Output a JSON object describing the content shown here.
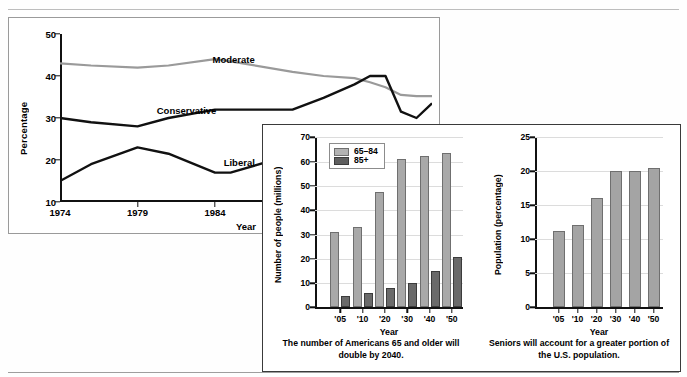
{
  "chart_data": [
    {
      "type": "line",
      "panel": "political-ideology-trend",
      "title": "",
      "xlabel": "Year",
      "ylabel": "Percentage",
      "ylim": [
        10,
        50
      ],
      "yticks": [
        10,
        20,
        30,
        40,
        50
      ],
      "xticks": [
        "1974",
        "1979",
        "1984",
        "1989",
        "1994"
      ],
      "x": [
        1974,
        1976,
        1979,
        1981,
        1984,
        1985,
        1989,
        1991,
        1993,
        1994,
        1995,
        1996,
        1997,
        1998
      ],
      "grid": false,
      "legend": "inline-labels",
      "series": [
        {
          "name": "Moderate",
          "color": "#9a9a9a",
          "label_x_pct": 41,
          "label_y_pct": 12,
          "values": [
            43.0,
            42.5,
            42.0,
            42.5,
            44.0,
            43.5,
            41.0,
            40.0,
            39.5,
            38.5,
            37.3,
            35.5,
            35.2,
            35.2
          ]
        },
        {
          "name": "Conservative",
          "color": "#111111",
          "label_x_pct": 26,
          "label_y_pct": 42,
          "values": [
            30.0,
            29.0,
            28.0,
            30.0,
            32.0,
            32.0,
            32.0,
            34.8,
            38.0,
            40.0,
            40.0,
            31.5,
            30.0,
            33.5
          ]
        },
        {
          "name": "Liberal",
          "color": "#111111",
          "label_x_pct": 44,
          "label_y_pct": 73,
          "values": [
            15.0,
            19.0,
            23.0,
            21.5,
            17.0,
            17.0,
            21.3,
            21.0,
            20.8,
            20.5,
            20.0,
            19.5,
            22.5,
            26.5
          ]
        }
      ]
    },
    {
      "type": "bar",
      "panel": "number-of-older-americans",
      "title": "",
      "xlabel": "Year",
      "ylabel": "Number of people (millions)",
      "ylim": [
        0,
        70
      ],
      "yticks": [
        0,
        10,
        20,
        30,
        40,
        50,
        60,
        70
      ],
      "categories": [
        "'05",
        "'10",
        "'20",
        "'30",
        "'40",
        "'50"
      ],
      "grid": true,
      "legend_position": "top-left",
      "caption": "The number of Americans 65 and older will double by 2040.",
      "series": [
        {
          "name": "65–84",
          "color": "#a9a9a9",
          "values": [
            31.2,
            33.1,
            47.5,
            61.0,
            62.3,
            63.5
          ]
        },
        {
          "name": "85+",
          "color": "#6a6a6a",
          "values": [
            4.9,
            5.8,
            8.2,
            10.0,
            14.8,
            20.7
          ]
        }
      ]
    },
    {
      "type": "bar",
      "panel": "seniors-share-of-population",
      "title": "",
      "xlabel": "Year",
      "ylabel": "Population (percentage)",
      "ylim": [
        0,
        25
      ],
      "yticks": [
        0,
        5,
        10,
        15,
        20,
        25
      ],
      "categories": [
        "'05",
        "'10",
        "'20",
        "'30",
        "'40",
        "'50"
      ],
      "grid": true,
      "caption": "Seniors will account for a greater portion of the U.S. population.",
      "series": [
        {
          "name": "Percentage of U.S. population age 65+",
          "color": "#a4a4a4",
          "values": [
            11.2,
            12.1,
            16.1,
            20.0,
            20.0,
            20.5
          ]
        }
      ]
    }
  ],
  "line_chart": {
    "ylabel": "Percentage",
    "xlabel": "Year",
    "yticks": [
      "50",
      "40",
      "30",
      "20",
      "10"
    ],
    "xticks": [
      "1974",
      "1979",
      "1984",
      "1989",
      "1994"
    ],
    "labels": {
      "moderate": "Moderate",
      "conservative": "Conservative",
      "liberal": "Liberal"
    }
  },
  "bar_left": {
    "ylabel": "Number of people (millions)",
    "xlabel": "Year",
    "yticks": [
      "70",
      "60",
      "50",
      "40",
      "30",
      "20",
      "10",
      "0"
    ],
    "xticks": [
      "'05",
      "'10",
      "'20",
      "'30",
      "'40",
      "'50"
    ],
    "legend": {
      "series1": "65–84",
      "series2": "85+"
    },
    "caption": "The number of Americans 65 and older will double by 2040."
  },
  "bar_right": {
    "ylabel": "Population (percentage)",
    "xlabel": "Year",
    "yticks": [
      "25",
      "20",
      "15",
      "10",
      "5",
      "0"
    ],
    "xticks": [
      "'05",
      "'10",
      "'20",
      "'30",
      "'40",
      "'50"
    ],
    "caption": "Seniors will account for a greater portion of the U.S. population."
  }
}
